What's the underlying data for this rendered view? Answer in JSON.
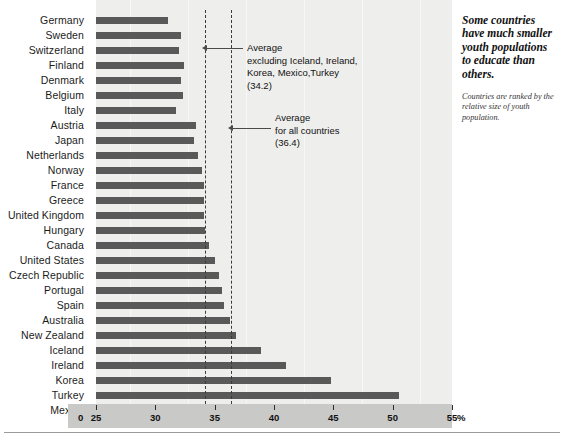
{
  "chart_data": {
    "type": "bar",
    "orientation": "horizontal",
    "title": "",
    "xlabel": "%",
    "ylabel": "",
    "xlim": [
      25,
      55
    ],
    "xticks": [
      25,
      30,
      35,
      40,
      45,
      50,
      55
    ],
    "xtick_labels": [
      "25",
      "30",
      "35",
      "40",
      "45",
      "50",
      "55"
    ],
    "axis_origin_label": "0",
    "unit_label": "%",
    "grid": false,
    "legend": "none",
    "categories": [
      "Germany",
      "Sweden",
      "Switzerland",
      "Finland",
      "Denmark",
      "Belgium",
      "Italy",
      "Austria",
      "Japan",
      "Netherlands",
      "Norway",
      "France",
      "Greece",
      "United Kingdom",
      "Hungary",
      "Canada",
      "United States",
      "Czech Republic",
      "Portugal",
      "Spain",
      "Australia",
      "New Zealand",
      "Iceland",
      "Ireland",
      "Korea",
      "Turkey",
      "Mexico"
    ],
    "values": [
      31.1,
      32.2,
      32.0,
      32.4,
      32.2,
      32.3,
      31.7,
      33.4,
      33.3,
      33.6,
      33.9,
      34.1,
      34.1,
      34.1,
      34.2,
      34.5,
      35.0,
      35.4,
      35.6,
      35.8,
      36.3,
      36.8,
      38.9,
      41.0,
      44.8,
      50.5,
      54.1
    ],
    "reference_lines": [
      {
        "label": "Average excluding Iceland, Ireland, Korea, Mexico, Turkey",
        "value": 34.2
      },
      {
        "label": "Average for all countries",
        "value": 36.4
      }
    ]
  },
  "annotations": {
    "avg_excluding": "Average\nexcluding Iceland, Ireland,\nKorea, Mexico,Turkey\n(34.2)",
    "avg_all": "Average\nfor all countries\n(36.4)"
  },
  "side_note": {
    "headline": "Some countries have much smaller youth populations to educate than others.",
    "subtext": "Countries are ranked by the relative size of youth population."
  },
  "colors": {
    "bar": "#595959",
    "panel": "#eeeeec",
    "axis_strip": "#c9c9c7",
    "dashed_line": "#3a3a3a"
  }
}
